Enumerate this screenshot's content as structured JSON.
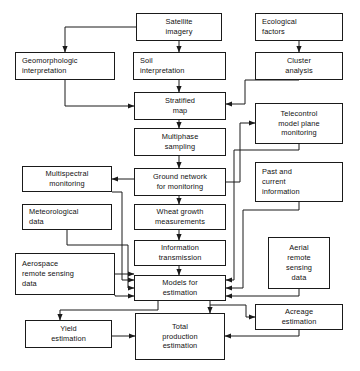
{
  "diagram": {
    "background": "#ffffff",
    "line_color": "#1a1a1a",
    "nodes": [
      {
        "id": "satellite_imagery",
        "label": "Satellite\nimagery",
        "x": 136,
        "y": 13,
        "w": 86,
        "h": 28,
        "align": "center"
      },
      {
        "id": "ecological_factors",
        "label": "Ecological\nfactors",
        "x": 255,
        "y": 13,
        "w": 88,
        "h": 28,
        "align": "left"
      },
      {
        "id": "geomorphologic_interpretation",
        "label": "Geomorphologic\ninterpretation",
        "x": 15,
        "y": 52,
        "w": 100,
        "h": 28,
        "align": "left"
      },
      {
        "id": "soil_interpretation",
        "label": "Soil\ninterpretation",
        "x": 133,
        "y": 52,
        "w": 93,
        "h": 28,
        "align": "left"
      },
      {
        "id": "cluster_analysis",
        "label": "Cluster\nanalysis",
        "x": 255,
        "y": 52,
        "w": 88,
        "h": 28,
        "align": "center"
      },
      {
        "id": "stratified_map",
        "label": "Stratified\nmap",
        "x": 134,
        "y": 92,
        "w": 92,
        "h": 28,
        "align": "center"
      },
      {
        "id": "telecontrol_model_plane_monitoring",
        "label": "Telecontrol\nmodel plane\nmonitoring",
        "x": 255,
        "y": 103,
        "w": 88,
        "h": 41,
        "align": "center"
      },
      {
        "id": "multiphase_sampling",
        "label": "Multiphase\nsampling",
        "x": 134,
        "y": 128,
        "w": 92,
        "h": 28,
        "align": "center"
      },
      {
        "id": "multispectral_monitoring",
        "label": "Multispectral\nmonitoring",
        "x": 22,
        "y": 166,
        "w": 90,
        "h": 26,
        "align": "center"
      },
      {
        "id": "ground_network_for_monitoring",
        "label": "Ground network\nfor monitoring",
        "x": 134,
        "y": 168,
        "w": 92,
        "h": 28,
        "align": "center"
      },
      {
        "id": "past_and_current_information",
        "label": "Past and\ncurrent\ninformation",
        "x": 255,
        "y": 162,
        "w": 88,
        "h": 40,
        "align": "left"
      },
      {
        "id": "meteorological_data",
        "label": "Meteorological\ndata",
        "x": 22,
        "y": 204,
        "w": 90,
        "h": 26,
        "align": "left"
      },
      {
        "id": "wheat_growth_measurements",
        "label": "Wheat growth\nmeasurements",
        "x": 134,
        "y": 204,
        "w": 92,
        "h": 26,
        "align": "center"
      },
      {
        "id": "information_transmission",
        "label": "Information\ntransmission",
        "x": 134,
        "y": 240,
        "w": 92,
        "h": 26,
        "align": "center"
      },
      {
        "id": "aerial_remote_sensing_data",
        "label": "Aerial\nremote\nsensing\ndata",
        "x": 268,
        "y": 237,
        "w": 62,
        "h": 52,
        "align": "center"
      },
      {
        "id": "aerospace_remote_sensing_data",
        "label": "Aerospace\nremote sensing\ndata",
        "x": 15,
        "y": 253,
        "w": 100,
        "h": 42,
        "align": "left"
      },
      {
        "id": "models_for_estimation",
        "label": "Models for\nestimation",
        "x": 134,
        "y": 275,
        "w": 92,
        "h": 26,
        "align": "center"
      },
      {
        "id": "acreage_estimation",
        "label": "Acreage\nestimation",
        "x": 255,
        "y": 304,
        "w": 88,
        "h": 26,
        "align": "center"
      },
      {
        "id": "yield_estimation",
        "label": "Yield\nestimation",
        "x": 25,
        "y": 320,
        "w": 87,
        "h": 28,
        "align": "center"
      },
      {
        "id": "total_production_estimation",
        "label": "Total\nproduction\nestimation",
        "x": 135,
        "y": 313,
        "w": 90,
        "h": 47,
        "align": "center"
      }
    ],
    "edges": [
      {
        "from": "satellite_imagery",
        "to": "geomorphologic_interpretation",
        "path": "M136,27 L65,27 L65,52",
        "arrow": "down"
      },
      {
        "from": "satellite_imagery",
        "to": "soil_interpretation",
        "path": "M179,41 L179,52",
        "arrow": "down"
      },
      {
        "from": "ecological_factors",
        "to": "cluster_analysis",
        "path": "M299,41 L299,52",
        "arrow": "down"
      },
      {
        "from": "soil_interpretation",
        "to": "stratified_map",
        "path": "M179,80 L179,92",
        "arrow": "down"
      },
      {
        "from": "geomorphologic_interpretation",
        "to": "stratified_map",
        "path": "M65,80 L65,106 L134,106",
        "arrow": "right"
      },
      {
        "from": "cluster_analysis",
        "to": "stratified_map",
        "path": "M299,80 L245,80 L245,104 L226,104",
        "arrow": "left"
      },
      {
        "from": "stratified_map",
        "to": "multiphase_sampling",
        "path": "M179,120 L179,128",
        "arrow": "down"
      },
      {
        "from": "multiphase_sampling",
        "to": "ground_network_for_monitoring",
        "path": "M179,156 L179,168",
        "arrow": "down"
      },
      {
        "from": "ground_network_for_monitoring",
        "to": "telecontrol_model_plane_monitoring",
        "path": "M226,182 L240,182 L240,123 L255,123",
        "arrow": "right"
      },
      {
        "from": "ground_network_for_monitoring",
        "to": "multispectral_monitoring",
        "path": "M134,179 L112,179",
        "arrow": "left"
      },
      {
        "from": "ground_network_for_monitoring",
        "to": "wheat_growth_measurements",
        "path": "M179,196 L179,204",
        "arrow": "down"
      },
      {
        "from": "wheat_growth_measurements",
        "to": "information_transmission",
        "path": "M179,230 L179,240",
        "arrow": "down"
      },
      {
        "from": "information_transmission",
        "to": "models_for_estimation",
        "path": "M179,266 L179,275",
        "arrow": "down"
      },
      {
        "from": "multispectral_monitoring",
        "to": "models_for_estimation",
        "path": "M112,192 L122,192 L122,280 L134,280",
        "arrow": "right"
      },
      {
        "from": "meteorological_data",
        "to": "models_for_estimation",
        "path": "M67,230 L67,245 L128,245 L128,288 L134,288",
        "arrow": "right"
      },
      {
        "from": "aerospace_remote_sensing_data",
        "to": "models_for_estimation",
        "path": "M115,274 L134,274",
        "arrow": "right"
      },
      {
        "from": "aerospace_remote_sensing_data",
        "to": "models_for_estimation_b",
        "path": "M115,295 L115,296 L134,296",
        "arrow": "right"
      },
      {
        "from": "telecontrol_model_plane_monitoring",
        "to": "models_for_estimation",
        "path": "M299,144 L299,150 L234,150 L234,280 L226,280",
        "arrow": "left"
      },
      {
        "from": "past_and_current_information",
        "to": "models_for_estimation",
        "path": "M299,202 L299,210 L243,210 L243,288 L226,288",
        "arrow": "left"
      },
      {
        "from": "aerial_remote_sensing_data",
        "to": "models_for_estimation",
        "path": "M299,289 L299,296 L226,296",
        "arrow": "left"
      },
      {
        "from": "models_for_estimation",
        "to": "yield_estimation",
        "path": "M158,301 L158,310 L60,310 L60,320",
        "arrow": "down"
      },
      {
        "from": "models_for_estimation",
        "to": "total_production_estimation",
        "path": "M210,301 L210,313",
        "arrow": "down"
      },
      {
        "from": "models_for_estimation",
        "to": "acreage_estimation",
        "path": "M210,305 L246,305 L246,317 L255,317",
        "arrow": "right"
      },
      {
        "from": "yield_estimation",
        "to": "total_production_estimation",
        "path": "M112,336 L135,336",
        "arrow": "right"
      },
      {
        "from": "acreage_estimation",
        "to": "total_production_estimation",
        "path": "M299,330 L299,336 L225,336",
        "arrow": "left"
      }
    ]
  }
}
